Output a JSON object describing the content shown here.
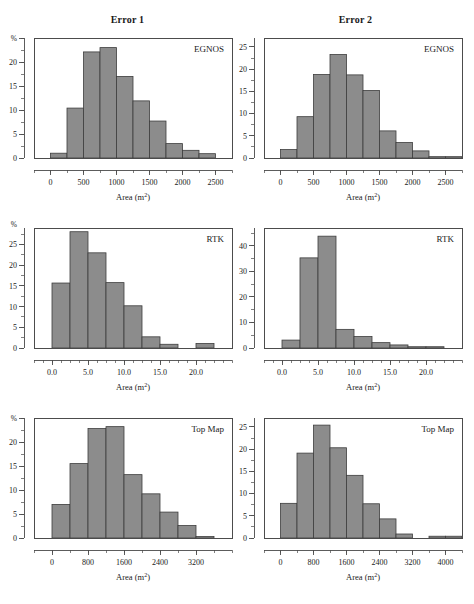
{
  "figure": {
    "column_titles": [
      "Error 1",
      "Error 2"
    ],
    "axis_title_text": "Area (m",
    "axis_title_sup": "2",
    "axis_title_tail": ")",
    "bar_fill": "#8c8c8c",
    "bar_stroke": "#3d3d3d",
    "axis_color": "#4a4a4a",
    "background": "#ffffff"
  },
  "chart_data": [
    {
      "type": "bar",
      "title": "Error 1",
      "panel_label": "EGNOS",
      "row": 0,
      "col": 0,
      "xlabel": "Area (m2)",
      "ylabel": "%",
      "ylabel_is_top_tick": true,
      "xlim": [
        -250,
        2750
      ],
      "ylim": [
        0,
        25
      ],
      "xticks": [
        0,
        500,
        1000,
        1500,
        2000,
        2500
      ],
      "xtick_labels": [
        "0",
        "500",
        "1000",
        "1500",
        "2000",
        "2500"
      ],
      "xminor_step": 250,
      "yticks": [
        0,
        5,
        10,
        15,
        20,
        25
      ],
      "ytick_labels": [
        "0",
        "5",
        "10",
        "15",
        "20",
        "%"
      ],
      "yminor_step": 2.5,
      "bin_edges": [
        0,
        250,
        500,
        750,
        1000,
        1250,
        1500,
        1750,
        2000,
        2250,
        2500
      ],
      "values": [
        1.0,
        10.4,
        22.1,
        23.0,
        17.0,
        11.9,
        7.7,
        3.0,
        1.6,
        0.9
      ],
      "grid": false,
      "legend_position": "top-right"
    },
    {
      "type": "bar",
      "title": "Error 2",
      "panel_label": "EGNOS",
      "row": 0,
      "col": 1,
      "xlabel": "Area (m2)",
      "ylabel": "",
      "ylabel_is_top_tick": false,
      "xlim": [
        -250,
        2750
      ],
      "ylim": [
        0,
        27
      ],
      "xticks": [
        0,
        500,
        1000,
        1500,
        2000,
        2500
      ],
      "xtick_labels": [
        "0",
        "500",
        "1000",
        "1500",
        "2000",
        "2500"
      ],
      "xminor_step": 250,
      "yticks": [
        0,
        5,
        10,
        15,
        20,
        25
      ],
      "ytick_labels": [
        "0",
        "5",
        "10",
        "15",
        "20",
        "25"
      ],
      "yminor_step": 2.5,
      "bin_edges": [
        0,
        250,
        500,
        750,
        1000,
        1250,
        1500,
        1750,
        2000,
        2250,
        2500,
        2750
      ],
      "values": [
        1.9,
        9.3,
        18.8,
        23.3,
        18.7,
        15.2,
        6.1,
        3.5,
        1.6,
        0.3,
        0.3
      ],
      "grid": false,
      "legend_position": "top-right"
    },
    {
      "type": "bar",
      "title": "Error 1",
      "panel_label": "RTK",
      "row": 1,
      "col": 0,
      "xlabel": "Area (m2)",
      "ylabel": "%",
      "ylabel_is_top_tick": false,
      "xlim": [
        -2.5,
        25.0
      ],
      "ylim": [
        0,
        29
      ],
      "xticks": [
        0.0,
        5.0,
        10.0,
        15.0,
        20.0
      ],
      "xtick_labels": [
        "0.0",
        "5.0",
        "10.0",
        "15.0",
        "20.0"
      ],
      "xminor_step": 1.25,
      "yticks": [
        0,
        5,
        10,
        15,
        20,
        25
      ],
      "ytick_labels": [
        "0",
        "5",
        "10",
        "15",
        "20",
        "25"
      ],
      "yminor_step": 2.5,
      "bin_edges": [
        0.0,
        2.5,
        5.0,
        7.5,
        10.0,
        12.5,
        15.0,
        17.5,
        20.0,
        22.5
      ],
      "values": [
        15.7,
        28.1,
        23.0,
        15.8,
        10.2,
        2.7,
        0.9,
        0.0,
        1.1
      ],
      "grid": false,
      "legend_position": "top-right"
    },
    {
      "type": "bar",
      "title": "Error 2",
      "panel_label": "RTK",
      "row": 1,
      "col": 1,
      "xlabel": "Area (m2)",
      "ylabel": "",
      "ylabel_is_top_tick": false,
      "xlim": [
        -2.5,
        25.0
      ],
      "ylim": [
        0,
        47
      ],
      "xticks": [
        0.0,
        5.0,
        10.0,
        15.0,
        20.0
      ],
      "xtick_labels": [
        "0.0",
        "5.0",
        "10.0",
        "15.0",
        "20.0"
      ],
      "xminor_step": 1.25,
      "yticks": [
        0,
        10,
        20,
        30,
        40
      ],
      "ytick_labels": [
        "0",
        "10",
        "20",
        "30",
        "40"
      ],
      "yminor_step": 5,
      "bin_edges": [
        0.0,
        2.5,
        5.0,
        7.5,
        10.0,
        12.5,
        15.0,
        17.5,
        20.0,
        22.5
      ],
      "values": [
        3.1,
        35.3,
        43.8,
        7.3,
        4.5,
        2.1,
        1.2,
        0.5,
        0.5
      ],
      "grid": false,
      "legend_position": "top-right"
    },
    {
      "type": "bar",
      "title": "Error 1",
      "panel_label": "Top Map",
      "row": 2,
      "col": 0,
      "xlabel": "Area (m2)",
      "ylabel": "%",
      "ylabel_is_top_tick": true,
      "xlim": [
        -400,
        4000
      ],
      "ylim": [
        0,
        25
      ],
      "xticks": [
        0,
        800,
        1600,
        2400,
        3200
      ],
      "xtick_labels": [
        "0",
        "800",
        "1600",
        "2400",
        "3200"
      ],
      "xminor_step": 400,
      "yticks": [
        0,
        5,
        10,
        15,
        20,
        25
      ],
      "ytick_labels": [
        "0",
        "5",
        "10",
        "15",
        "20",
        "%"
      ],
      "yminor_step": 2.5,
      "bin_edges": [
        0,
        400,
        800,
        1200,
        1600,
        2000,
        2400,
        2800,
        3200,
        3600
      ],
      "values": [
        7.0,
        15.5,
        22.8,
        23.2,
        13.2,
        9.2,
        5.4,
        2.6,
        0.3
      ],
      "grid": false,
      "legend_position": "top-right"
    },
    {
      "type": "bar",
      "title": "Error 2",
      "panel_label": "Top Map",
      "row": 2,
      "col": 1,
      "xlabel": "Area (m2)",
      "ylabel": "",
      "ylabel_is_top_tick": false,
      "xlim": [
        -400,
        4400
      ],
      "ylim": [
        0,
        27
      ],
      "xticks": [
        0,
        800,
        1600,
        2400,
        3200,
        4000
      ],
      "xtick_labels": [
        "0",
        "800",
        "1600",
        "2400",
        "3200",
        "4000"
      ],
      "xminor_step": 400,
      "yticks": [
        0,
        5,
        10,
        15,
        20,
        25
      ],
      "ytick_labels": [
        "0",
        "5",
        "10",
        "15",
        "20",
        "25"
      ],
      "yminor_step": 2.5,
      "bin_edges": [
        0,
        400,
        800,
        1200,
        1600,
        2000,
        2400,
        2800,
        3200,
        3600,
        4000,
        4400
      ],
      "values": [
        7.8,
        19.1,
        25.4,
        20.3,
        14.1,
        7.7,
        4.3,
        0.9,
        0.0,
        0.4,
        0.4
      ],
      "grid": false,
      "legend_position": "top-right"
    }
  ]
}
